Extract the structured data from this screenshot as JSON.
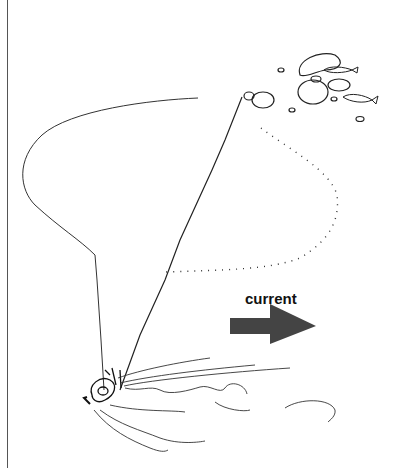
{
  "diagram": {
    "labels": {
      "current": "current"
    },
    "colors": {
      "arrow": "#444444",
      "line": "#222222",
      "background": "#ffffff"
    },
    "elements": [
      "anchor-rope-line",
      "drifting-rope-curve",
      "dotted-path",
      "rocks-cluster",
      "fish",
      "current-arrow",
      "seabed-sediment-plume",
      "diver-figure"
    ]
  }
}
